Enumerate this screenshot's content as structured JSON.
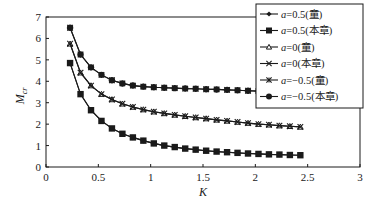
{
  "chart_data": {
    "type": "line",
    "title": "",
    "xlabel": "K",
    "ylabel": "M_cr",
    "xlim": [
      0,
      3
    ],
    "ylim": [
      0,
      7
    ],
    "xticks": [
      "0",
      "0.5",
      "1",
      "1.5",
      "2",
      "2.5",
      "3"
    ],
    "yticks": [
      "0",
      "1",
      "2",
      "3",
      "4",
      "5",
      "6",
      "7"
    ],
    "grid": false,
    "legend_position": "upper right",
    "x": [
      0.23,
      0.33,
      0.43,
      0.53,
      0.63,
      0.73,
      0.83,
      0.93,
      1.03,
      1.13,
      1.23,
      1.33,
      1.43,
      1.53,
      1.63,
      1.73,
      1.83,
      1.93,
      2.03,
      2.13,
      2.23,
      2.33,
      2.43
    ],
    "series": [
      {
        "name": "a=0.5(童)",
        "marker": "diamond",
        "values": [
          4.85,
          3.4,
          2.65,
          2.15,
          1.8,
          1.55,
          1.38,
          1.23,
          1.1,
          1.0,
          0.93,
          0.86,
          0.81,
          0.76,
          0.72,
          0.69,
          0.66,
          0.63,
          0.61,
          0.59,
          0.58,
          0.56,
          0.55
        ]
      },
      {
        "name": "a=0.5(本章)",
        "marker": "square",
        "values": [
          4.85,
          3.4,
          2.65,
          2.15,
          1.8,
          1.55,
          1.38,
          1.23,
          1.1,
          1.0,
          0.93,
          0.86,
          0.81,
          0.76,
          0.72,
          0.69,
          0.66,
          0.63,
          0.61,
          0.59,
          0.58,
          0.56,
          0.55
        ]
      },
      {
        "name": "a=0(童)",
        "marker": "triangle",
        "values": [
          5.75,
          4.4,
          3.8,
          3.4,
          3.15,
          2.95,
          2.8,
          2.68,
          2.58,
          2.5,
          2.43,
          2.37,
          2.31,
          2.26,
          2.2,
          2.15,
          2.1,
          2.05,
          2.0,
          1.97,
          1.93,
          1.9,
          1.87
        ]
      },
      {
        "name": "a=0(本章)",
        "marker": "x",
        "values": [
          5.75,
          4.4,
          3.8,
          3.4,
          3.15,
          2.95,
          2.8,
          2.68,
          2.58,
          2.5,
          2.43,
          2.37,
          2.31,
          2.26,
          2.2,
          2.15,
          2.1,
          2.05,
          2.0,
          1.97,
          1.93,
          1.9,
          1.87
        ]
      },
      {
        "name": "a=-0.5(童)",
        "marker": "star",
        "values": [
          6.5,
          5.25,
          4.65,
          4.3,
          4.05,
          3.9,
          3.8,
          3.75,
          3.72,
          3.7,
          3.68,
          3.66,
          3.65,
          3.63,
          3.62,
          3.6,
          3.58,
          3.56,
          3.54,
          3.52,
          3.5,
          3.49,
          3.48
        ]
      },
      {
        "name": "a=-0.5(本章)",
        "marker": "circle",
        "values": [
          6.5,
          5.25,
          4.65,
          4.3,
          4.05,
          3.9,
          3.8,
          3.75,
          3.72,
          3.7,
          3.68,
          3.66,
          3.65,
          3.63,
          3.62,
          3.6,
          3.58,
          3.56,
          3.54,
          3.52,
          3.5,
          3.49,
          3.48
        ]
      }
    ]
  },
  "legend": {
    "items": [
      {
        "prefix": "a",
        "text": "=0.5(童)",
        "marker": "diamond"
      },
      {
        "prefix": "a",
        "text": "=0.5(本章)",
        "marker": "square"
      },
      {
        "prefix": "a",
        "text": "=0(童)",
        "marker": "triangle"
      },
      {
        "prefix": "a",
        "text": "=0(本章)",
        "marker": "x"
      },
      {
        "prefix": "a",
        "text": "=−0.5(童)",
        "marker": "star"
      },
      {
        "prefix": "a",
        "text": "=−0.5(本章)",
        "marker": "circle"
      }
    ]
  },
  "axes": {
    "xlabel": "K",
    "ylabel_main": "M",
    "ylabel_sub": "cr"
  },
  "colors": {
    "line": "#1a1a1a",
    "axis": "#1a1a1a",
    "background": "#ffffff"
  }
}
